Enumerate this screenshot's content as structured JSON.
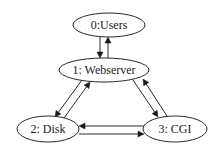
{
  "diagram": {
    "type": "directed-graph",
    "background": "#ffffff",
    "stroke_color": "#2a2a2a",
    "nodes": [
      {
        "id": "0",
        "label": "0:Users",
        "cx": 109,
        "cy": 25,
        "rx": 36,
        "ry": 12
      },
      {
        "id": "1",
        "label": "1: Webserver",
        "cx": 104,
        "cy": 70,
        "rx": 45,
        "ry": 12
      },
      {
        "id": "2",
        "label": "2: Disk",
        "cx": 48,
        "cy": 129,
        "rx": 31,
        "ry": 13
      },
      {
        "id": "3",
        "label": "3: CGI",
        "cx": 175,
        "cy": 129,
        "rx": 32,
        "ry": 13
      }
    ],
    "edges": [
      {
        "from": "0",
        "to": "1",
        "label": "Users to Webserver",
        "x1": 100,
        "y1": 37,
        "x2": 100,
        "y2": 58
      },
      {
        "from": "1",
        "to": "0",
        "label": "Webserver to Users",
        "x1": 108,
        "y1": 58,
        "x2": 108,
        "y2": 37
      },
      {
        "from": "1",
        "to": "2",
        "label": "Webserver to Disk",
        "x1": 82,
        "y1": 80,
        "x2": 55,
        "y2": 117
      },
      {
        "from": "2",
        "to": "1",
        "label": "Disk to Webserver",
        "x1": 64,
        "y1": 118,
        "x2": 90,
        "y2": 82
      },
      {
        "from": "1",
        "to": "3",
        "label": "Webserver to CGI",
        "x1": 133,
        "y1": 80,
        "x2": 158,
        "y2": 117
      },
      {
        "from": "3",
        "to": "1",
        "label": "CGI to Webserver",
        "x1": 167,
        "y1": 116,
        "x2": 143,
        "y2": 79
      },
      {
        "from": "3",
        "to": "2",
        "label": "CGI to Disk",
        "x1": 144,
        "y1": 126,
        "x2": 79,
        "y2": 126
      },
      {
        "from": "2",
        "to": "3",
        "label": "Disk to CGI",
        "x1": 79,
        "y1": 134,
        "x2": 144,
        "y2": 134
      }
    ]
  }
}
